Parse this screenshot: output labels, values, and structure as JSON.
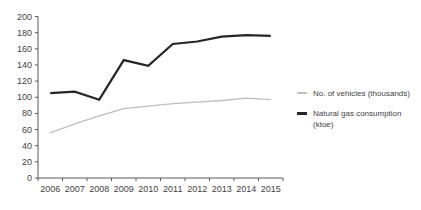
{
  "chart_data": {
    "type": "line",
    "title": "",
    "xlabel": "",
    "ylabel": "",
    "categories": [
      "2006",
      "2007",
      "2008",
      "2009",
      "2010",
      "2011",
      "2012",
      "2013",
      "2014",
      "2015"
    ],
    "series": [
      {
        "name": "No. of vehicles (thousands)",
        "values": [
          56,
          67,
          77,
          86,
          89,
          92,
          94,
          96,
          99,
          97
        ],
        "color": "#bfbfbf"
      },
      {
        "name": "Natural gas consumption (ktoe)",
        "values": [
          105,
          107,
          97,
          146,
          139,
          166,
          169,
          175,
          177,
          176
        ],
        "color": "#262626"
      }
    ],
    "ylim": [
      0,
      200
    ],
    "ytick_step": 20,
    "grid": false,
    "legend_position": "right",
    "axis_color": "#595959",
    "tick_label_color": "#3f3f3f",
    "background": "#ffffff"
  }
}
